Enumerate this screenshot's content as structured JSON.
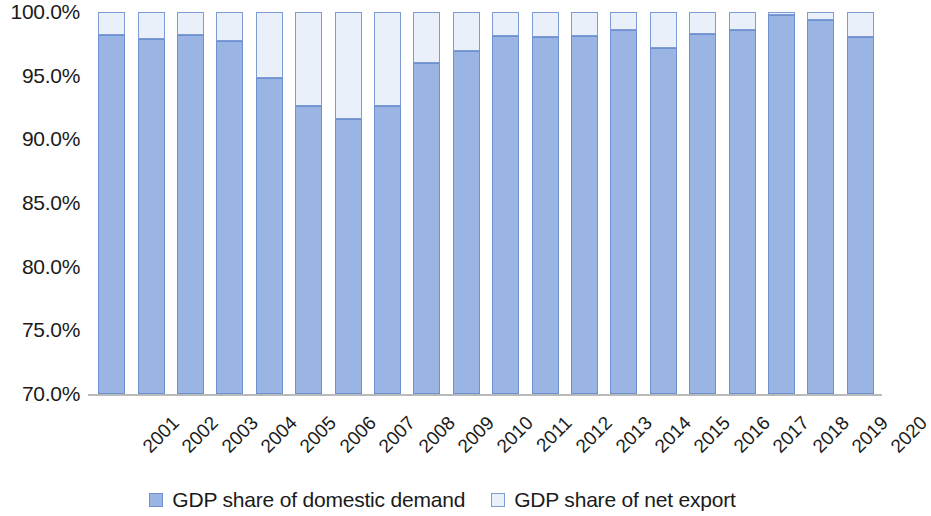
{
  "chart_data": {
    "type": "bar",
    "stacked": true,
    "title": "",
    "subtitle": "",
    "xlabel": "",
    "ylabel": "",
    "ylim": [
      70.0,
      100.0
    ],
    "y_tick_labels": [
      "100.0%",
      "95.0%",
      "90.0%",
      "85.0%",
      "80.0%",
      "75.0%",
      "70.0%"
    ],
    "y_tick_values": [
      100.0,
      95.0,
      90.0,
      85.0,
      80.0,
      75.0,
      70.0
    ],
    "grid": false,
    "legend_position": "bottom",
    "categories": [
      "2001",
      "2002",
      "2003",
      "2004",
      "2005",
      "2006",
      "2007",
      "2008",
      "2009",
      "2010",
      "2011",
      "2012",
      "2013",
      "2014",
      "2015",
      "2016",
      "2017",
      "2018",
      "2019",
      "2020"
    ],
    "series": [
      {
        "name": "GDP share of domestic demand",
        "color": "#9ab4e3",
        "border_color": "#6f90ce",
        "values": [
          98.2,
          97.9,
          98.2,
          97.7,
          94.8,
          92.6,
          91.6,
          92.6,
          96.0,
          96.9,
          98.1,
          98.0,
          98.1,
          98.6,
          97.2,
          98.3,
          98.6,
          99.8,
          99.4,
          98.0
        ]
      },
      {
        "name": "GDP share of net export",
        "color": "#e9f0fa",
        "border_color": "#7d9bd4",
        "values": [
          1.8,
          2.1,
          1.8,
          2.3,
          5.2,
          7.4,
          8.4,
          7.4,
          4.0,
          3.1,
          1.9,
          2.0,
          1.9,
          1.4,
          2.8,
          1.7,
          1.4,
          0.2,
          0.6,
          2.0
        ]
      }
    ]
  },
  "legend": {
    "items": [
      {
        "label": "GDP share of domestic demand",
        "swatch": "domestic"
      },
      {
        "label": "GDP share of net export",
        "swatch": "export"
      }
    ]
  }
}
